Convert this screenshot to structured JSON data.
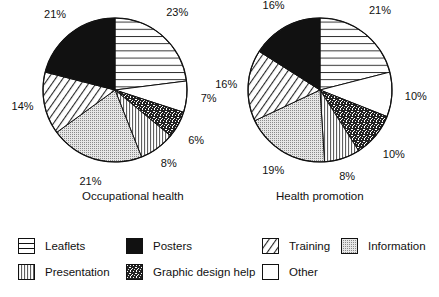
{
  "chart_data": [
    {
      "type": "pie",
      "title": "Occupational health",
      "categories": [
        "Leaflets",
        "Other",
        "Graphic design help",
        "Presentation",
        "Information",
        "Training",
        "Posters"
      ],
      "values": [
        23,
        7,
        6,
        8,
        21,
        14,
        21
      ],
      "labels": [
        "23%",
        "7%",
        "6%",
        "8%",
        "21%",
        "14%",
        "21%"
      ],
      "start_angle": "12 o'clock",
      "direction": "clockwise"
    },
    {
      "type": "pie",
      "title": "Health promotion",
      "categories": [
        "Leaflets",
        "Other",
        "Graphic design help",
        "Presentation",
        "Information",
        "Training",
        "Posters"
      ],
      "values": [
        21,
        10,
        10,
        8,
        19,
        16,
        16
      ],
      "labels": [
        "21%",
        "10%",
        "10%",
        "8%",
        "19%",
        "16%",
        "16%"
      ],
      "start_angle": "12 o'clock",
      "direction": "clockwise"
    }
  ],
  "titles": {
    "left": "Occupational health",
    "right": "Health promotion"
  },
  "legend": [
    {
      "label": "Leaflets",
      "pattern": "horizontal-lines"
    },
    {
      "label": "Posters",
      "pattern": "solid-black"
    },
    {
      "label": "Training",
      "pattern": "diagonal-lines"
    },
    {
      "label": "Information",
      "pattern": "fine-dots"
    },
    {
      "label": "Presentation",
      "pattern": "vertical-lines"
    },
    {
      "label": "Graphic design help",
      "pattern": "speckled-dark"
    },
    {
      "label": "Other",
      "pattern": "white"
    }
  ]
}
